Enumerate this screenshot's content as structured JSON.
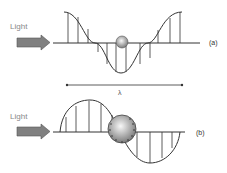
{
  "panel_a": {
    "light_label": "Light",
    "panel_label": "(a)"
  },
  "wavelength": {
    "symbol": "λ"
  },
  "panel_b": {
    "light_label": "Light",
    "panel_label": "(b)"
  },
  "colors": {
    "line": "#333333",
    "arrow_fill": "#808080",
    "text": "#888888",
    "particle_light": "#f2f2f2",
    "particle_dark": "#888888"
  }
}
